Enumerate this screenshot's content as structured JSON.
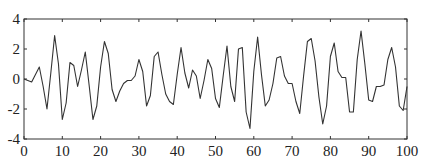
{
  "chart_data": {
    "type": "line",
    "title": "",
    "xlabel": "",
    "ylabel": "",
    "xlim": [
      0,
      100
    ],
    "ylim": [
      -4,
      4
    ],
    "grid": false,
    "legend": null,
    "xticks": [
      0,
      10,
      20,
      30,
      40,
      50,
      60,
      70,
      80,
      90,
      100
    ],
    "yticks": [
      -4,
      -2,
      0,
      2,
      4
    ],
    "series": [
      {
        "name": "signal",
        "color": "#333333",
        "x": [
          0,
          1,
          2,
          3,
          4,
          5,
          6,
          7,
          8,
          9,
          10,
          11,
          12,
          13,
          14,
          15,
          16,
          17,
          18,
          19,
          20,
          21,
          22,
          23,
          24,
          25,
          26,
          27,
          28,
          29,
          30,
          31,
          32,
          33,
          34,
          35,
          36,
          37,
          38,
          39,
          40,
          41,
          42,
          43,
          44,
          45,
          46,
          47,
          48,
          49,
          50,
          51,
          52,
          53,
          54,
          55,
          56,
          57,
          58,
          59,
          60,
          61,
          62,
          63,
          64,
          65,
          66,
          67,
          68,
          69,
          70,
          71,
          72,
          73,
          74,
          75,
          76,
          77,
          78,
          79,
          80,
          81,
          82,
          83,
          84,
          85,
          86,
          87,
          88,
          89,
          90,
          91,
          92,
          93,
          94,
          95,
          96,
          97,
          98,
          99,
          100
        ],
        "values": [
          0,
          -0.1,
          -0.2,
          0.3,
          0.8,
          -0.5,
          -2.0,
          0.4,
          2.9,
          1.0,
          -2.7,
          -1.6,
          1.1,
          0.9,
          -0.5,
          0.6,
          1.8,
          -0.4,
          -2.7,
          -1.8,
          0.8,
          2.5,
          1.7,
          -0.7,
          -1.5,
          -0.8,
          -0.3,
          -0.1,
          -0.1,
          0.2,
          1.3,
          0.5,
          -1.8,
          -1.1,
          1.5,
          1.8,
          0.3,
          -1.0,
          -1.5,
          -1.7,
          0.3,
          2.1,
          0.4,
          -0.6,
          0.6,
          0.2,
          -1.3,
          -0.1,
          1.3,
          0.7,
          -1.3,
          -1.9,
          0.2,
          2.2,
          -0.5,
          -1.5,
          2.0,
          2.1,
          -2.2,
          -3.3,
          0.5,
          2.8,
          0.3,
          -1.8,
          -1.4,
          -0.3,
          1.4,
          1.5,
          0.2,
          -0.3,
          -0.3,
          -1.5,
          -2.3,
          0.2,
          2.5,
          2.7,
          1.2,
          -1.2,
          -3.0,
          -1.8,
          1.5,
          2.4,
          0.5,
          0.1,
          0.1,
          -2.2,
          -2.2,
          1.3,
          3.2,
          1.0,
          -1.4,
          -1.5,
          -0.5,
          -0.5,
          -0.4,
          1.3,
          2.1,
          0.8,
          -1.8,
          -2.1,
          -0.5
        ]
      }
    ]
  },
  "plot_box": {
    "left": 24,
    "top": 19,
    "right": 407,
    "bottom": 139
  }
}
